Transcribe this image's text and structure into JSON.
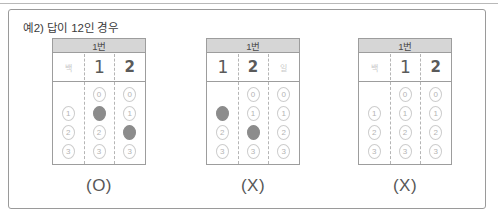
{
  "frame": {
    "title": "예2) 답이 12인 경우"
  },
  "bubble_rows": [
    "0",
    "1",
    "2",
    "3"
  ],
  "cards": [
    {
      "header": "1번",
      "verdict": "(O)",
      "columns": [
        {
          "place_label": "백",
          "written": "",
          "written_style": "none",
          "bubbles": [
            {
              "label": "0",
              "state": "blank"
            },
            {
              "label": "1",
              "state": "empty"
            },
            {
              "label": "2",
              "state": "empty"
            },
            {
              "label": "3",
              "state": "empty"
            }
          ]
        },
        {
          "place_label": "",
          "written": "1",
          "written_style": "one",
          "bubbles": [
            {
              "label": "0",
              "state": "empty"
            },
            {
              "label": "1",
              "state": "filled"
            },
            {
              "label": "2",
              "state": "empty"
            },
            {
              "label": "3",
              "state": "empty"
            }
          ]
        },
        {
          "place_label": "",
          "written": "2",
          "written_style": "normal",
          "bubbles": [
            {
              "label": "0",
              "state": "empty"
            },
            {
              "label": "1",
              "state": "empty"
            },
            {
              "label": "2",
              "state": "filled"
            },
            {
              "label": "3",
              "state": "empty"
            }
          ]
        }
      ]
    },
    {
      "header": "1번",
      "verdict": "(X)",
      "columns": [
        {
          "place_label": "",
          "written": "1",
          "written_style": "one",
          "bubbles": [
            {
              "label": "0",
              "state": "blank"
            },
            {
              "label": "1",
              "state": "filled"
            },
            {
              "label": "2",
              "state": "empty"
            },
            {
              "label": "3",
              "state": "empty"
            }
          ]
        },
        {
          "place_label": "",
          "written": "2",
          "written_style": "normal",
          "bubbles": [
            {
              "label": "0",
              "state": "empty"
            },
            {
              "label": "1",
              "state": "empty"
            },
            {
              "label": "2",
              "state": "filled"
            },
            {
              "label": "3",
              "state": "empty"
            }
          ]
        },
        {
          "place_label": "일",
          "written": "",
          "written_style": "none",
          "bubbles": [
            {
              "label": "0",
              "state": "empty"
            },
            {
              "label": "1",
              "state": "empty"
            },
            {
              "label": "2",
              "state": "empty"
            },
            {
              "label": "3",
              "state": "empty"
            }
          ]
        }
      ]
    },
    {
      "header": "1번",
      "verdict": "(X)",
      "columns": [
        {
          "place_label": "백",
          "written": "",
          "written_style": "none",
          "bubbles": [
            {
              "label": "0",
              "state": "blank"
            },
            {
              "label": "1",
              "state": "empty"
            },
            {
              "label": "2",
              "state": "empty"
            },
            {
              "label": "3",
              "state": "empty"
            }
          ]
        },
        {
          "place_label": "",
          "written": "1",
          "written_style": "one",
          "bubbles": [
            {
              "label": "0",
              "state": "empty"
            },
            {
              "label": "1",
              "state": "empty"
            },
            {
              "label": "2",
              "state": "empty"
            },
            {
              "label": "3",
              "state": "empty"
            }
          ]
        },
        {
          "place_label": "",
          "written": "2",
          "written_style": "normal",
          "bubbles": [
            {
              "label": "0",
              "state": "empty"
            },
            {
              "label": "1",
              "state": "empty"
            },
            {
              "label": "2",
              "state": "empty"
            },
            {
              "label": "3",
              "state": "empty"
            }
          ]
        }
      ]
    }
  ],
  "colors": {
    "frame_border": "#9a9a9a",
    "card_border": "#9d9d9d",
    "header_bg": "#d6d6d6",
    "bubble_fill": "#8c8c8c",
    "bubble_outline": "#cdcdcd",
    "dashed_guide": "#b5b5b5",
    "text": "#3b3b3b"
  }
}
